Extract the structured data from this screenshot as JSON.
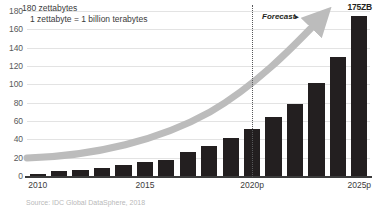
{
  "chart_data": {
    "type": "bar",
    "title": "180 zettabytes",
    "subtitle": "1 zettabyte = 1 billion terabytes",
    "xlabel": "",
    "ylabel": "zettabytes",
    "ylim": [
      0,
      180
    ],
    "yticks": [
      0,
      20,
      40,
      60,
      80,
      100,
      120,
      140,
      160,
      180
    ],
    "ytick_labels": [
      "0",
      "20",
      "40",
      "60",
      "80",
      "100",
      "120",
      "140",
      "160",
      "180"
    ],
    "grid": true,
    "legend": "none",
    "categories": [
      "2010",
      "2011",
      "2012",
      "2013",
      "2014",
      "2015",
      "2016",
      "2017",
      "2018",
      "2019",
      "2020p",
      "2021p",
      "2022p",
      "2023p",
      "2024p",
      "2025p"
    ],
    "xtick_labels": [
      "2010",
      "2015",
      "2020p",
      "2025p"
    ],
    "values": [
      2,
      5,
      6.5,
      9,
      12.5,
      15.5,
      18,
      26,
      33,
      41,
      51,
      64,
      79,
      101,
      130,
      175
    ],
    "bar_color": "#231f20",
    "grid_color": "#e3e3e3",
    "annotations": [
      {
        "name": "forecast-divider",
        "label": "Forecast",
        "marker": "▸",
        "at_category": "2020p"
      },
      {
        "name": "final-value-callout",
        "label": "175ZB",
        "at_category": "2025p",
        "value": 175
      },
      {
        "name": "trend-arrow",
        "label": "",
        "color": "#bcbcbc"
      }
    ],
    "source": "Source: IDC Global DataSphere, 2018"
  },
  "header": {
    "title": "180 zettabytes",
    "subtitle": "1 zettabyte = 1 billion terabytes"
  },
  "forecast": {
    "label": "Forecast",
    "marker": "▸"
  },
  "callout": {
    "value_label": "175ZB"
  },
  "footer": {
    "source": "Source: IDC Global DataSphere, 2018"
  }
}
